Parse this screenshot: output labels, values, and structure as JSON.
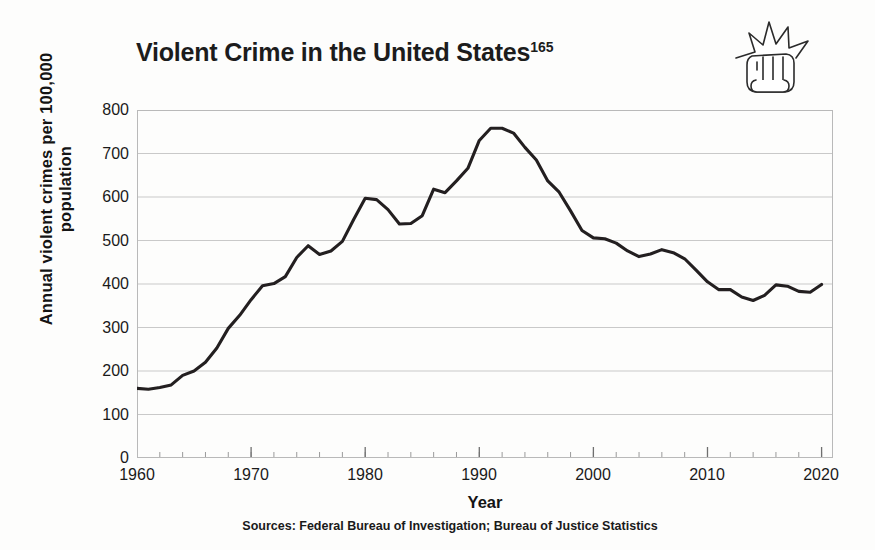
{
  "figure": {
    "title_main": "Violent Crime in the United States",
    "title_superscript": "165",
    "source_note": "Sources: Federal Bureau of Investigation; Bureau of Justice Statistics",
    "icon_label": "fist-punch-icon"
  },
  "chart_data": {
    "type": "line",
    "title": "Violent Crime in the United States",
    "xlabel": "Year",
    "ylabel": "Annual violent crimes per 100,000 population",
    "xlim": [
      1960,
      2021
    ],
    "ylim": [
      0,
      800
    ],
    "grid": true,
    "legend": "none",
    "line_color": "#231f20",
    "x_major_ticks": [
      1960,
      1970,
      1980,
      1990,
      2000,
      2010,
      2020
    ],
    "x_minor_tick_interval": 2,
    "y_ticks": [
      0,
      100,
      200,
      300,
      400,
      500,
      600,
      700,
      800
    ],
    "x": [
      1960,
      1961,
      1962,
      1963,
      1964,
      1965,
      1966,
      1967,
      1968,
      1969,
      1970,
      1971,
      1972,
      1973,
      1974,
      1975,
      1976,
      1977,
      1978,
      1979,
      1980,
      1981,
      1982,
      1983,
      1984,
      1985,
      1986,
      1987,
      1988,
      1989,
      1990,
      1991,
      1992,
      1993,
      1994,
      1995,
      1996,
      1997,
      1998,
      1999,
      2000,
      2001,
      2002,
      2003,
      2004,
      2005,
      2006,
      2007,
      2008,
      2009,
      2010,
      2011,
      2012,
      2013,
      2014,
      2015,
      2016,
      2017,
      2018,
      2019,
      2020
    ],
    "y": [
      160,
      158,
      162,
      168,
      190,
      200,
      220,
      253,
      298,
      328,
      364,
      396,
      401,
      417,
      461,
      488,
      468,
      476,
      498,
      549,
      597,
      594,
      571,
      538,
      539,
      557,
      618,
      610,
      637,
      666,
      730,
      758,
      758,
      747,
      714,
      685,
      637,
      611,
      568,
      523,
      506,
      504,
      494,
      476,
      463,
      469,
      479,
      472,
      458,
      432,
      405,
      387,
      387,
      370,
      362,
      374,
      398,
      395,
      383,
      381,
      399
    ]
  },
  "axes": {
    "y_tick_labels": [
      "800",
      "700",
      "600",
      "500",
      "400",
      "300",
      "200",
      "100",
      "0"
    ],
    "x_tick_labels": [
      "1960",
      "1970",
      "1980",
      "1990",
      "2000",
      "2010",
      "2020"
    ],
    "x_title": "Year",
    "y_title": "Annual violent crimes per 100,000 population"
  }
}
